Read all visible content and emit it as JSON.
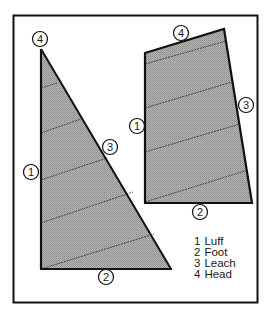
{
  "diagram": {
    "type": "sail-parts",
    "colors": {
      "border": "#111111",
      "sail_fill": "#a9a9a9",
      "sail_outline": "#111111",
      "seam": "#333333",
      "circle_fill": "#ffffff"
    },
    "triangular_sail": {
      "markers": [
        {
          "num": "4",
          "part": "Head"
        },
        {
          "num": "1",
          "part": "Luff"
        },
        {
          "num": "3",
          "part": "Leach"
        },
        {
          "num": "2",
          "part": "Foot"
        }
      ]
    },
    "gaff_sail": {
      "markers": [
        {
          "num": "4",
          "part": "Head"
        },
        {
          "num": "1",
          "part": "Luff"
        },
        {
          "num": "3",
          "part": "Leach"
        },
        {
          "num": "2",
          "part": "Foot"
        }
      ]
    },
    "legend": [
      {
        "num": "1",
        "label": "Luff"
      },
      {
        "num": "2",
        "label": "Foot"
      },
      {
        "num": "3",
        "label": "Leach"
      },
      {
        "num": "4",
        "label": "Head"
      }
    ]
  }
}
